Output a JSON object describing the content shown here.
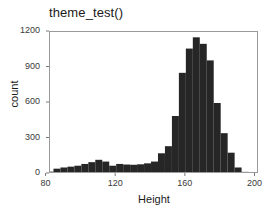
{
  "chart_data": {
    "type": "bar",
    "title": "theme_test()",
    "xlabel": "Height",
    "ylabel": "count",
    "xlim": [
      82,
      202
    ],
    "ylim": [
      0,
      1200
    ],
    "grid": false,
    "legend": null,
    "bin_width": 4,
    "x_ticks": [
      80,
      120,
      160,
      200
    ],
    "x_tick_labels": [
      "80",
      "120",
      "160",
      "200"
    ],
    "y_ticks": [
      0,
      300,
      600,
      900,
      1200
    ],
    "y_tick_labels": [
      "0",
      "300",
      "600",
      "900",
      "1200"
    ],
    "bar_color": "#262626",
    "categories": [
      "82",
      "86",
      "90",
      "94",
      "98",
      "102",
      "106",
      "110",
      "114",
      "118",
      "122",
      "126",
      "130",
      "134",
      "138",
      "142",
      "146",
      "150",
      "154",
      "158",
      "162",
      "166",
      "170",
      "174",
      "178",
      "182",
      "186",
      "190",
      "194",
      "198"
    ],
    "bin_centers": [
      82,
      86,
      90,
      94,
      98,
      102,
      106,
      110,
      114,
      118,
      122,
      126,
      130,
      134,
      138,
      142,
      146,
      150,
      154,
      158,
      162,
      166,
      170,
      174,
      178,
      182,
      186,
      190,
      194,
      198
    ],
    "values": [
      20,
      45,
      55,
      62,
      70,
      85,
      100,
      120,
      105,
      70,
      85,
      80,
      78,
      82,
      90,
      105,
      175,
      235,
      490,
      855,
      1060,
      1155,
      1100,
      960,
      600,
      345,
      180,
      55,
      18,
      6
    ]
  }
}
